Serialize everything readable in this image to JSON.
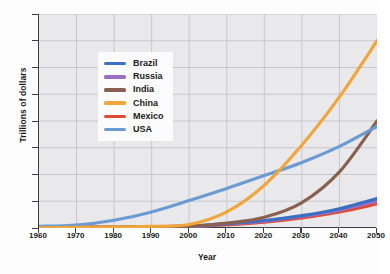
{
  "chart_data": {
    "type": "line",
    "title": "",
    "xlabel": "Year",
    "ylabel": "Trillions of dollars",
    "xlim": [
      1960,
      2050
    ],
    "ylim": [
      0,
      80
    ],
    "xticks": [
      1960,
      1970,
      1980,
      1990,
      2000,
      2010,
      2020,
      2030,
      2040,
      2050
    ],
    "yticks": [
      0,
      10,
      20,
      30,
      40,
      50,
      60,
      70,
      80
    ],
    "grid": true,
    "legend_position": "upper-left-inset",
    "x": [
      1960,
      1970,
      1980,
      1990,
      2000,
      2010,
      2020,
      2030,
      2040,
      2050
    ],
    "series": [
      {
        "name": "Brazil",
        "color": "#3a6fc4",
        "values": [
          0.1,
          0.2,
          0.3,
          0.5,
          0.7,
          1.6,
          2.8,
          4.6,
          7.2,
          11.0
        ]
      },
      {
        "name": "Russia",
        "color": "#9b6fc4",
        "values": [
          0.1,
          0.2,
          0.3,
          0.5,
          0.4,
          1.5,
          2.6,
          4.3,
          6.7,
          10.0
        ]
      },
      {
        "name": "India",
        "color": "#8a6050",
        "values": [
          0.1,
          0.2,
          0.3,
          0.5,
          0.6,
          1.8,
          4.0,
          9.5,
          21.0,
          40.0
        ]
      },
      {
        "name": "China",
        "color": "#f0a63c",
        "values": [
          0.1,
          0.2,
          0.4,
          0.6,
          1.3,
          6.0,
          16.0,
          31.0,
          49.0,
          70.0
        ]
      },
      {
        "name": "Mexico",
        "color": "#e04c32",
        "values": [
          0.1,
          0.2,
          0.3,
          0.4,
          0.7,
          1.2,
          2.2,
          3.8,
          6.0,
          9.0
        ]
      },
      {
        "name": "USA",
        "color": "#6b9bd2",
        "values": [
          0.6,
          1.1,
          2.9,
          6.0,
          10.3,
          14.8,
          19.6,
          24.5,
          30.5,
          38.0
        ]
      }
    ]
  }
}
